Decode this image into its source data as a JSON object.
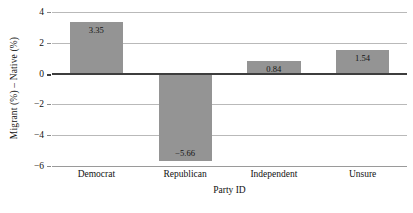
{
  "chart_data": {
    "type": "bar",
    "title": "",
    "subtitle": "",
    "xlabel": "Party ID",
    "ylabel": "Migrant (%) – Native (%)",
    "categories": [
      "Democrat",
      "Republican",
      "Independent",
      "Unsure"
    ],
    "values": [
      3.35,
      -5.66,
      0.84,
      1.54
    ],
    "value_labels": [
      "3.35",
      "−5.66",
      "0.84",
      "1.54"
    ],
    "ylim": [
      -6,
      4
    ],
    "yticks": [
      4,
      2,
      0,
      -2,
      -4,
      -6
    ],
    "ytick_labels": [
      "4",
      "2",
      "0",
      "−2",
      "−4",
      "−6"
    ],
    "grid": true,
    "legend": false,
    "legend_position": "none",
    "bar_color": "#949494",
    "gridline_color": "#b9b9b9",
    "zero_line_color": "#3d3d3d",
    "background_color": "#ffffff"
  }
}
